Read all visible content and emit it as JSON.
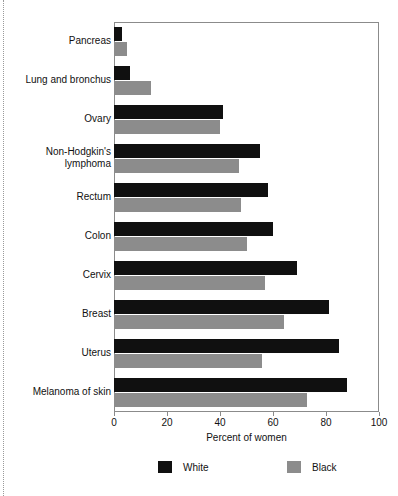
{
  "chart_data": {
    "type": "bar",
    "orientation": "horizontal",
    "title": "",
    "subtitle": "",
    "xlabel": "Percent of women",
    "ylabel": "",
    "xlim": [
      0,
      100
    ],
    "xticks": [
      0,
      20,
      40,
      60,
      80,
      100
    ],
    "xtick_labels": [
      "0",
      "20",
      "40",
      "60",
      "80",
      "100"
    ],
    "grid": false,
    "legend_position": "bottom",
    "categories": [
      "Pancreas",
      "Lung and bronchus",
      "Ovary",
      "Non-Hodgkin's\nlymphoma",
      "Rectum",
      "Colon",
      "Cervix",
      "Breast",
      "Uterus",
      "Melanoma of skin"
    ],
    "series": [
      {
        "name": "White",
        "color": "#101010",
        "values": [
          3,
          6,
          41,
          55,
          58,
          60,
          69,
          81,
          85,
          88
        ]
      },
      {
        "name": "Black",
        "color": "#8c8c8c",
        "values": [
          5,
          14,
          40,
          47,
          48,
          50,
          57,
          64,
          56,
          73
        ]
      }
    ],
    "legend": [
      {
        "label": "White",
        "color": "#101010"
      },
      {
        "label": "Black",
        "color": "#8c8c8c"
      }
    ]
  }
}
